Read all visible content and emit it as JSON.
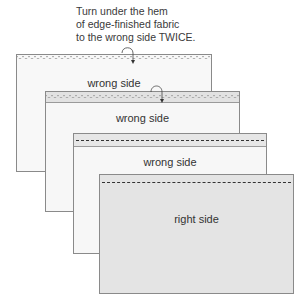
{
  "caption": {
    "line1": "Turn under the hem",
    "line2": "of edge-finished fabric",
    "line3": "to the wrong side TWICE."
  },
  "panels": [
    {
      "label": "wrong side",
      "hem": "edge-finished scalloped edge"
    },
    {
      "label": "wrong side",
      "hem": "folded once"
    },
    {
      "label": "wrong side",
      "hem": "folded twice, stitched"
    },
    {
      "label": "right side",
      "hem": "stitching visible"
    }
  ],
  "colors": {
    "wrong_side": "#f7f7f7",
    "right_side": "#e4e4e4",
    "outline": "#8a8a8a",
    "stitch": "#333333"
  }
}
